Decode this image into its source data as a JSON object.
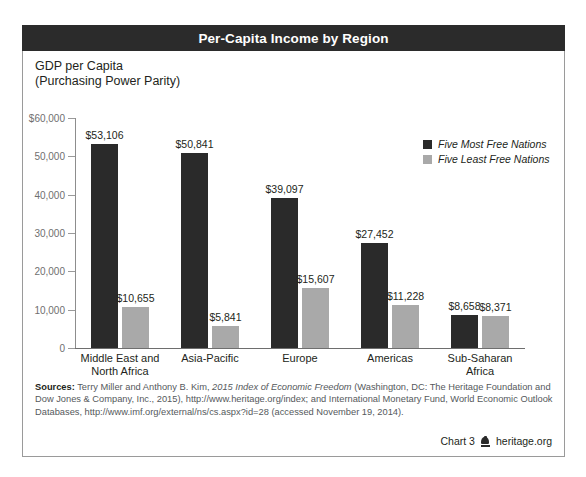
{
  "header": {
    "title": "Per-Capita Income by Region"
  },
  "subtitle_line1": "GDP per Capita",
  "subtitle_line2": "(Purchasing Power Parity)",
  "legend": {
    "items": [
      {
        "label": "Five Most Free Nations",
        "color": "#2a2a2a",
        "swatch": "dark"
      },
      {
        "label": "Five Least Free Nations",
        "color": "#a9a9a9",
        "swatch": "light"
      }
    ]
  },
  "sources": {
    "label": "Sources:",
    "text_1": " Terry Miller and Anthony B. Kim, ",
    "italic_1": "2015 Index of Economic Freedom",
    "text_2": " (Washington, DC: The Heritage Foundation and Dow Jones & Company, Inc., 2015), http://www.heritage.org/index; and International Monetary Fund, World Economic Outlook Databases, http://www.imf.org/external/ns/cs.aspx?id=28 (accessed November 19, 2014)."
  },
  "footer": {
    "chart_number": "Chart 3",
    "logo_name": "heritage-bell-logo",
    "site": "heritage.org"
  },
  "chart_data": {
    "type": "bar",
    "title": "Per-Capita Income by Region",
    "subtitle": "GDP per Capita (Purchasing Power Parity)",
    "xlabel": "",
    "ylabel": "GDP per Capita (Purchasing Power Parity)",
    "ylim": [
      0,
      60000
    ],
    "grid": false,
    "legend_position": "top-right",
    "ytick_labels": [
      "$60,000",
      "50,000",
      "40,000",
      "30,000",
      "20,000",
      "10,000",
      "0"
    ],
    "ytick_values": [
      60000,
      50000,
      40000,
      30000,
      20000,
      10000,
      0
    ],
    "categories": [
      "Middle East and North Africa",
      "Asia-Pacific",
      "Europe",
      "Americas",
      "Sub-Saharan Africa"
    ],
    "category_lines": [
      [
        "Middle East and",
        "North Africa"
      ],
      [
        "Asia-Pacific"
      ],
      [
        "Europe"
      ],
      [
        "Americas"
      ],
      [
        "Sub-Saharan",
        "Africa"
      ]
    ],
    "series": [
      {
        "name": "Five Most Free Nations",
        "color": "#2a2a2a",
        "values": [
          53106,
          50841,
          39097,
          27452,
          8658
        ],
        "value_labels": [
          "$53,106",
          "$50,841",
          "$39,097",
          "$27,452",
          "$8,658"
        ]
      },
      {
        "name": "Five Least Free Nations",
        "color": "#a9a9a9",
        "values": [
          10655,
          5841,
          15607,
          11228,
          8371
        ],
        "value_labels": [
          "$10,655",
          "$5,841",
          "$15,607",
          "$11,228",
          "$8,371"
        ]
      }
    ]
  }
}
